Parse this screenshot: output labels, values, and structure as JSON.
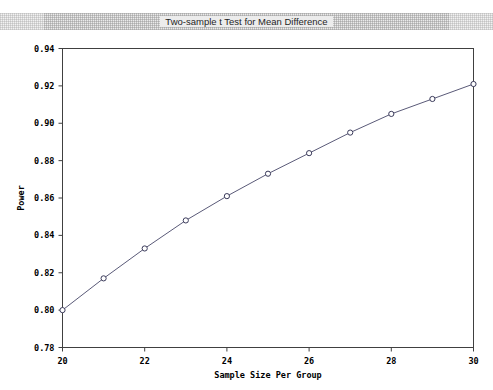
{
  "window": {
    "title": "Two-sample t Test for Mean Difference"
  },
  "axis": {
    "y_label": "Power",
    "x_label": "Sample Size Per Group",
    "y_ticks": [
      "0.78",
      "0.80",
      "0.82",
      "0.84",
      "0.86",
      "0.88",
      "0.90",
      "0.92",
      "0.94"
    ],
    "x_ticks": [
      "20",
      "22",
      "24",
      "26",
      "28",
      "30"
    ]
  },
  "chart_data": {
    "type": "line",
    "title": "Two-sample t Test for Mean Difference",
    "xlabel": "Sample Size Per Group",
    "ylabel": "Power",
    "xlim": [
      20,
      30
    ],
    "ylim": [
      0.78,
      0.94
    ],
    "xticks": [
      20,
      22,
      24,
      26,
      28,
      30
    ],
    "yticks": [
      0.78,
      0.8,
      0.82,
      0.84,
      0.86,
      0.88,
      0.9,
      0.92,
      0.94
    ],
    "grid": false,
    "legend": "none",
    "marker": "open-circle",
    "line_color": "#5a5a78",
    "marker_edge_color": "#3a3a5a",
    "marker_face_color": "#ffffff",
    "x": [
      20,
      21,
      22,
      23,
      24,
      25,
      26,
      27,
      28,
      29,
      30
    ],
    "values": [
      0.8,
      0.817,
      0.833,
      0.848,
      0.861,
      0.873,
      0.884,
      0.895,
      0.905,
      0.913,
      0.921
    ],
    "series": [
      {
        "name": "Power",
        "x": [
          20,
          21,
          22,
          23,
          24,
          25,
          26,
          27,
          28,
          29,
          30
        ],
        "values": [
          0.8,
          0.817,
          0.833,
          0.848,
          0.861,
          0.873,
          0.884,
          0.895,
          0.905,
          0.913,
          0.921
        ]
      }
    ]
  }
}
